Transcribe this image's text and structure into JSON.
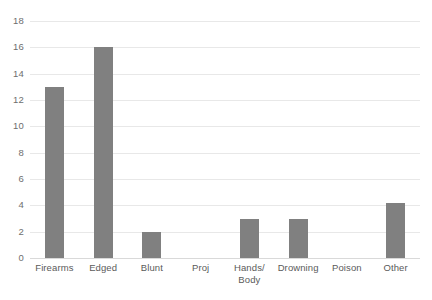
{
  "chart_data": {
    "type": "bar",
    "title": "",
    "subtitle": "",
    "xlabel": "",
    "ylabel": "",
    "categories": [
      "Firearms",
      "Edged",
      "Blunt",
      "Proj",
      "Hands/\nBody",
      "Drowning",
      "Poison",
      "Other"
    ],
    "category_lines": [
      [
        "Firearms"
      ],
      [
        "Edged"
      ],
      [
        "Blunt"
      ],
      [
        "Proj"
      ],
      [
        "Hands/",
        "Body"
      ],
      [
        "Drowning"
      ],
      [
        "Poison"
      ],
      [
        "Other"
      ]
    ],
    "values": [
      13,
      16,
      2,
      0,
      3,
      3,
      0,
      4.2
    ],
    "ylim": [
      0,
      18
    ],
    "ytick_labels": [
      "0",
      "2",
      "4",
      "6",
      "8",
      "10",
      "12",
      "14",
      "16",
      "18"
    ],
    "ytick_values": [
      0,
      2,
      4,
      6,
      8,
      10,
      12,
      14,
      16,
      18
    ],
    "grid": true,
    "grid_axis": "y",
    "legend": false,
    "legend_position": "none",
    "bar_color": "#808080",
    "grid_color": "#e8e8e8",
    "axis_color": "#d9d9d9",
    "tick_label_color": "#5a5a5a",
    "background": "#ffffff",
    "bar_width_px": 19,
    "annotations": []
  }
}
